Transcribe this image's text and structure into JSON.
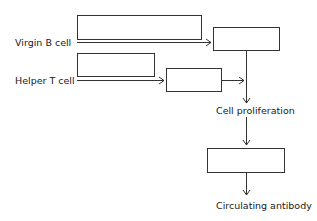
{
  "diagram": {
    "type": "flowchart",
    "labels": {
      "virgin_b_cell": "Virgin B cell",
      "helper_t_cell": "Helper T cell",
      "cell_proliferation": "Cell proliferation",
      "circulating_antibody": "Circulating antibody"
    },
    "boxes": [
      {
        "id": "box-1",
        "text": ""
      },
      {
        "id": "box-2",
        "text": ""
      },
      {
        "id": "box-3",
        "text": ""
      },
      {
        "id": "box-4",
        "text": ""
      },
      {
        "id": "box-5",
        "text": ""
      }
    ],
    "colors": {
      "line": "#333333",
      "text": "#1a1a1a",
      "background": "#ffffff"
    }
  }
}
